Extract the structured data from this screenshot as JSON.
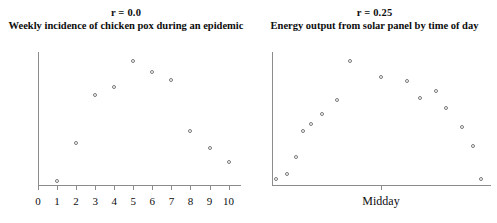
{
  "chart_data": [
    {
      "type": "scatter",
      "panel": "left",
      "title": "r = 0.0",
      "subtitle": "Weekly incidence of chicken pox during an epidemic",
      "xlabel": "",
      "ylabel": "",
      "grid": false,
      "legend": "none",
      "xlim": [
        0,
        10.6
      ],
      "ylim": [
        0,
        100
      ],
      "xticks": [
        "0",
        "1",
        "2",
        "3",
        "4",
        "5",
        "6",
        "7",
        "8",
        "9",
        "10"
      ],
      "xtick_values": [
        0,
        1,
        2,
        3,
        4,
        5,
        6,
        7,
        8,
        9,
        10
      ],
      "points": [
        {
          "x": 1,
          "y": 4
        },
        {
          "x": 2,
          "y": 32
        },
        {
          "x": 3,
          "y": 68
        },
        {
          "x": 4,
          "y": 74
        },
        {
          "x": 5,
          "y": 93
        },
        {
          "x": 6,
          "y": 85
        },
        {
          "x": 7,
          "y": 79
        },
        {
          "x": 8,
          "y": 41
        },
        {
          "x": 9,
          "y": 28
        },
        {
          "x": 10,
          "y": 18
        }
      ]
    },
    {
      "type": "scatter",
      "panel": "right",
      "title": "r = 0.25",
      "subtitle": "Energy output from solar panel by time of day",
      "xlabel": "Midday",
      "ylabel": "",
      "grid": false,
      "legend": "none",
      "xlim": [
        0,
        100
      ],
      "ylim": [
        0,
        100
      ],
      "xticks": [
        "Midday"
      ],
      "xtick_values": [
        50
      ],
      "points": [
        {
          "x": 2,
          "y": 5
        },
        {
          "x": 7,
          "y": 9
        },
        {
          "x": 11,
          "y": 22
        },
        {
          "x": 14,
          "y": 41
        },
        {
          "x": 18,
          "y": 46
        },
        {
          "x": 23,
          "y": 54
        },
        {
          "x": 30,
          "y": 64
        },
        {
          "x": 36,
          "y": 93
        },
        {
          "x": 50,
          "y": 81
        },
        {
          "x": 62,
          "y": 78
        },
        {
          "x": 68,
          "y": 66
        },
        {
          "x": 75,
          "y": 71
        },
        {
          "x": 80,
          "y": 58
        },
        {
          "x": 87,
          "y": 44
        },
        {
          "x": 92,
          "y": 30
        },
        {
          "x": 96,
          "y": 5
        }
      ]
    }
  ]
}
